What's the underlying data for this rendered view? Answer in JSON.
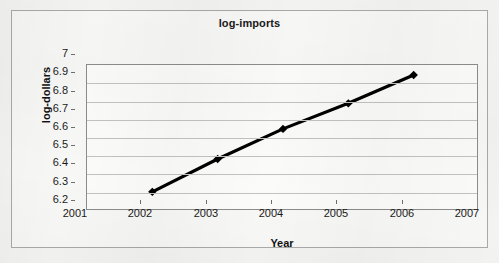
{
  "chart_data": {
    "type": "line",
    "title": "log-imports",
    "xlabel": "Year",
    "ylabel": "log-dollars",
    "x": [
      2002,
      2003,
      2004,
      2005,
      2006
    ],
    "values": [
      6.305,
      6.485,
      6.65,
      6.79,
      6.945
    ],
    "series": [
      {
        "name": "log-imports",
        "x": [
          2002,
          2003,
          2004,
          2005,
          2006
        ],
        "values": [
          6.305,
          6.485,
          6.65,
          6.79,
          6.945
        ]
      }
    ],
    "xlim": [
      2001,
      2007
    ],
    "ylim": [
      6.2,
      7.0
    ],
    "xticks": [
      2001,
      2002,
      2003,
      2004,
      2005,
      2006,
      2007
    ],
    "xtick_labels": [
      "2001",
      "2002",
      "2003",
      "2004",
      "2005",
      "2006",
      "2007"
    ],
    "yticks": [
      6.2,
      6.3,
      6.4,
      6.5,
      6.6,
      6.7,
      6.8,
      6.9,
      7.0
    ],
    "ytick_labels": [
      "6.2",
      "6.3",
      "6.4",
      "6.5",
      "6.6",
      "6.7",
      "6.8",
      "6.9",
      "7"
    ],
    "grid": "horizontal",
    "legend": "none",
    "marker": "diamond",
    "line_color": "#000000",
    "marker_color": "#000000",
    "grid_color": "#c2c2c2",
    "plot_border_color": "#8c8c8c",
    "frame_border_color": "#a9a9a9",
    "background_color": "#f7f7f6"
  }
}
